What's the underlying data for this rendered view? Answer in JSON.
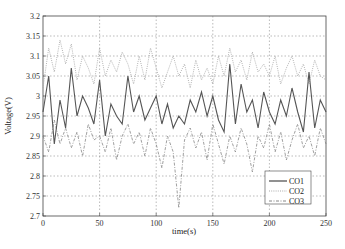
{
  "chart_data": {
    "type": "line",
    "title": "",
    "xlabel": "time(s)",
    "ylabel": "Voltage(V)",
    "xlim": [
      0,
      250
    ],
    "ylim": [
      2.7,
      3.2
    ],
    "xticks": [
      0,
      50,
      100,
      150,
      200,
      250
    ],
    "yticks": [
      2.7,
      2.75,
      2.8,
      2.85,
      2.9,
      2.95,
      3.0,
      3.05,
      3.1,
      3.15,
      3.2
    ],
    "ytick_labels": [
      "2.7",
      "2.75",
      "2.8",
      "2.85",
      "2.9",
      "2.95",
      "3",
      "3.05",
      "3.1",
      "3.15",
      "3.2"
    ],
    "grid": true,
    "legend_position": "lower right",
    "x": [
      0,
      5,
      10,
      15,
      20,
      25,
      30,
      35,
      40,
      45,
      50,
      55,
      60,
      65,
      70,
      75,
      80,
      85,
      90,
      95,
      100,
      105,
      110,
      115,
      120,
      125,
      130,
      135,
      140,
      145,
      150,
      155,
      160,
      165,
      170,
      175,
      180,
      185,
      190,
      195,
      200,
      205,
      210,
      215,
      220,
      225,
      230,
      235,
      240,
      245,
      250
    ],
    "series": [
      {
        "name": "CO1",
        "style": "solid",
        "color": "#555555",
        "values": [
          2.96,
          3.05,
          2.88,
          2.99,
          2.92,
          3.07,
          2.95,
          3.0,
          2.97,
          2.93,
          3.04,
          2.9,
          2.98,
          2.95,
          2.93,
          3.05,
          2.96,
          3.0,
          2.94,
          2.97,
          3.0,
          2.93,
          2.98,
          2.92,
          2.95,
          2.93,
          2.99,
          2.96,
          3.01,
          2.95,
          3.0,
          2.94,
          2.91,
          3.08,
          2.93,
          3.03,
          2.96,
          2.99,
          2.92,
          3.01,
          2.96,
          2.93,
          2.99,
          2.95,
          3.02,
          2.96,
          2.91,
          3.06,
          2.92,
          2.99,
          2.96
        ]
      },
      {
        "name": "CO2",
        "style": "dotted",
        "color": "#aaaaaa",
        "values": [
          3.02,
          3.12,
          3.06,
          3.14,
          3.08,
          3.13,
          3.04,
          3.1,
          3.07,
          3.03,
          3.12,
          3.05,
          3.09,
          3.06,
          3.11,
          3.08,
          3.03,
          3.1,
          3.04,
          3.12,
          3.07,
          3.02,
          3.06,
          3.1,
          3.05,
          3.08,
          3.02,
          3.09,
          3.04,
          3.07,
          3.03,
          3.1,
          3.05,
          3.12,
          3.06,
          3.09,
          3.04,
          3.11,
          3.06,
          3.08,
          3.05,
          3.1,
          3.03,
          3.07,
          3.1,
          3.05,
          3.08,
          3.03,
          3.09,
          3.05,
          3.04
        ]
      },
      {
        "name": "CO3",
        "style": "dashdot",
        "color": "#888888",
        "values": [
          2.9,
          2.86,
          2.94,
          2.88,
          2.92,
          2.87,
          2.91,
          2.85,
          2.93,
          2.89,
          2.9,
          2.86,
          2.92,
          2.84,
          2.9,
          2.93,
          2.88,
          2.91,
          2.85,
          2.92,
          2.88,
          2.82,
          2.9,
          2.86,
          2.72,
          2.89,
          2.92,
          2.87,
          2.91,
          2.84,
          2.93,
          2.88,
          2.83,
          2.9,
          2.86,
          2.92,
          2.88,
          2.81,
          2.9,
          2.87,
          2.93,
          2.86,
          2.91,
          2.84,
          2.89,
          2.93,
          2.87,
          2.9,
          2.85,
          2.92,
          2.88
        ]
      }
    ]
  }
}
